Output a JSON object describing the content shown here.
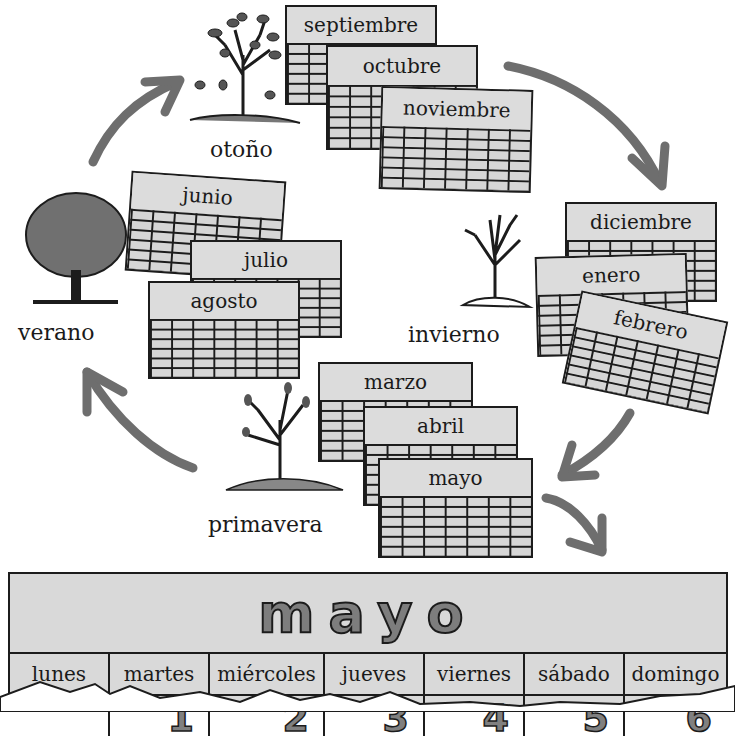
{
  "seasons": {
    "otono": "otoño",
    "invierno": "invierno",
    "primavera": "primavera",
    "verano": "verano"
  },
  "months": {
    "septiembre": "septiembre",
    "octubre": "octubre",
    "noviembre": "noviembre",
    "diciembre": "diciembre",
    "enero": "enero",
    "febrero": "febrero",
    "marzo": "marzo",
    "abril": "abril",
    "mayo": "mayo",
    "junio": "junio",
    "julio": "julio",
    "agosto": "agosto"
  },
  "calendar": {
    "title": "mayo",
    "weekdays": [
      "lunes",
      "martes",
      "miércoles",
      "jueves",
      "viernes",
      "sábado",
      "domingo"
    ],
    "dates": [
      "",
      "1",
      "2",
      "3",
      "4",
      "5",
      "6"
    ]
  },
  "colors": {
    "calendar_fill": "#d9d9d9",
    "arrow": "#6e6e6e",
    "ink": "#1c1c1c",
    "title_fill": "#7d7d7d"
  }
}
